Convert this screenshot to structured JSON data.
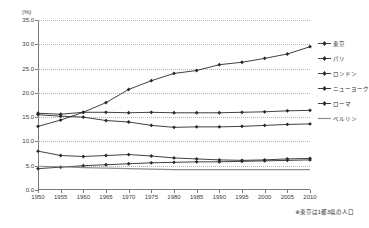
{
  "chart_data": {
    "type": "line",
    "title": "",
    "subtitle": "",
    "xlabel": "",
    "ylabel": "(%)",
    "unit_label": "(%)",
    "grid": true,
    "legend_position": "right",
    "xlim": [
      1950,
      2010
    ],
    "ylim": [
      0.0,
      35.0
    ],
    "ytick_labels": [
      "0.0",
      "5.0",
      "10.0",
      "15.0",
      "20.0",
      "25.0",
      "30.0",
      "35.0"
    ],
    "ytick_values": [
      0.0,
      5.0,
      10.0,
      15.0,
      20.0,
      25.0,
      30.0,
      35.0
    ],
    "categories": [
      1950,
      1955,
      1960,
      1965,
      1970,
      1975,
      1980,
      1985,
      1990,
      1995,
      2000,
      2005,
      2010
    ],
    "xtick_labels": [
      "1950",
      "1955",
      "1960",
      "1965",
      "1970",
      "1975",
      "1980",
      "1985",
      "1990",
      "1995",
      "2000",
      "2005",
      "2010"
    ],
    "series": [
      {
        "name": "東京",
        "marker": "diamond",
        "color": "#2b2b2b",
        "values": [
          13.1,
          14.4,
          16.0,
          18.0,
          20.7,
          22.5,
          24.0,
          24.6,
          25.8,
          26.3,
          27.1,
          28.0,
          29.5
        ]
      },
      {
        "name": "パリ",
        "marker": "diamond",
        "color": "#2b2b2b",
        "values": [
          15.8,
          15.6,
          16.0,
          16.0,
          15.9,
          16.0,
          15.9,
          15.9,
          15.9,
          16.0,
          16.1,
          16.3,
          16.4
        ]
      },
      {
        "name": "ロンドン",
        "marker": "diamond",
        "color": "#2b2b2b",
        "values": [
          8.0,
          7.1,
          6.9,
          7.1,
          7.3,
          7.0,
          6.6,
          6.4,
          6.2,
          6.1,
          6.2,
          6.4,
          6.5
        ]
      },
      {
        "name": "ニューヨーク",
        "marker": "diamond",
        "color": "#2b2b2b",
        "values": [
          15.5,
          15.2,
          15.0,
          14.3,
          14.0,
          13.3,
          12.9,
          13.0,
          13.0,
          13.1,
          13.3,
          13.5,
          13.6
        ]
      },
      {
        "name": "ローマ",
        "marker": "diamond",
        "color": "#2b2b2b",
        "values": [
          4.4,
          4.7,
          5.0,
          5.2,
          5.4,
          5.6,
          5.7,
          5.8,
          5.8,
          5.9,
          6.0,
          6.1,
          6.2
        ]
      },
      {
        "name": "ベルリン",
        "marker": "line",
        "color": "#8c8c8c",
        "values": [
          4.9,
          4.8,
          4.6,
          4.5,
          4.4,
          4.3,
          4.2,
          4.2,
          4.2,
          4.2,
          4.2,
          4.2,
          4.2
        ]
      }
    ],
    "annotation": "※東京は1都3県の人口"
  },
  "footnote": "※東京は1都3県の人口",
  "legend": {
    "items": [
      {
        "label": "東京"
      },
      {
        "label": "パリ"
      },
      {
        "label": "ロンドン"
      },
      {
        "label": "ニューヨーク"
      },
      {
        "label": "ローマ"
      },
      {
        "label": "ベルリン"
      }
    ]
  }
}
